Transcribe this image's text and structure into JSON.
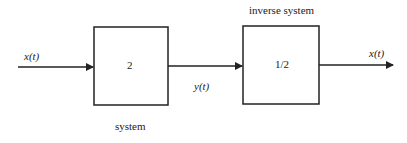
{
  "diagram": {
    "input_signal": "x(t)",
    "system": {
      "gain": "2",
      "label": "system"
    },
    "intermediate_signal": "y(t)",
    "inverse_system": {
      "gain": "1/2",
      "label": "inverse system"
    },
    "output_signal": "x(t)",
    "colors": {
      "stroke": "#222222",
      "background": "#ffffff"
    }
  }
}
